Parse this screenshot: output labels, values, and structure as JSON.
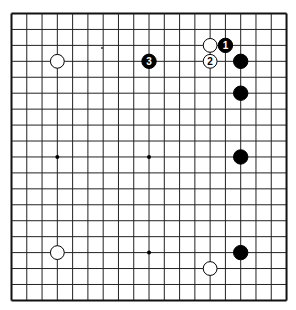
{
  "board": {
    "size": 19,
    "origin_x": 11.5,
    "origin_y": 13.5,
    "spacing_x": 15.28,
    "spacing_y": 15.94,
    "line_color": "#222222",
    "border_color": "#111111",
    "background": "#ffffff"
  },
  "star_points": [
    [
      3,
      3
    ],
    [
      9,
      3
    ],
    [
      15,
      3
    ],
    [
      3,
      9
    ],
    [
      9,
      9
    ],
    [
      15,
      9
    ],
    [
      3,
      15
    ],
    [
      9,
      15
    ],
    [
      15,
      15
    ]
  ],
  "stones": [
    {
      "color": "white",
      "col": 3,
      "row": 3,
      "label": ""
    },
    {
      "color": "black",
      "col": 9,
      "row": 3,
      "label": "3"
    },
    {
      "color": "white",
      "col": 13,
      "row": 2,
      "label": ""
    },
    {
      "color": "black",
      "col": 14,
      "row": 2,
      "label": "1"
    },
    {
      "color": "white",
      "col": 13,
      "row": 3,
      "label": "2"
    },
    {
      "color": "black",
      "col": 15,
      "row": 3,
      "label": ""
    },
    {
      "color": "black",
      "col": 15,
      "row": 5,
      "label": ""
    },
    {
      "color": "black",
      "col": 15,
      "row": 9,
      "label": ""
    },
    {
      "color": "black",
      "col": 15,
      "row": 15,
      "label": ""
    },
    {
      "color": "white",
      "col": 3,
      "row": 15,
      "label": ""
    },
    {
      "color": "white",
      "col": 13,
      "row": 16,
      "label": ""
    }
  ],
  "move_labels": {
    "move1": "1",
    "move2": "2",
    "move3": "3"
  },
  "artifacts": [
    {
      "x": 102,
      "y": 48,
      "r": 1
    }
  ]
}
